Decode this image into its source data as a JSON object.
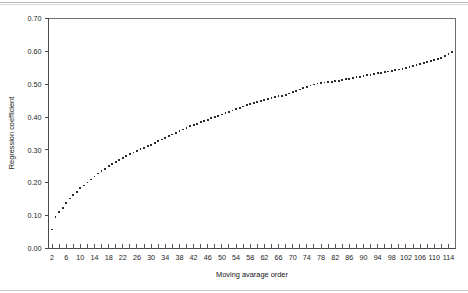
{
  "figure": {
    "background_color": "#ffffff",
    "axis_color": "#4a4a4a",
    "marker_color": "#2b2b2b"
  },
  "chart_data": {
    "type": "scatter",
    "title": "",
    "xlabel": "Moving avarage order",
    "ylabel": "Regression coefficient",
    "xlim": [
      1,
      116
    ],
    "ylim": [
      0.0,
      0.7
    ],
    "grid": false,
    "legend": null,
    "x_ticklabels": [
      "2",
      "6",
      "10",
      "14",
      "18",
      "22",
      "26",
      "30",
      "34",
      "38",
      "42",
      "46",
      "50",
      "54",
      "58",
      "62",
      "66",
      "70",
      "74",
      "78",
      "82",
      "86",
      "90",
      "94",
      "98",
      "102",
      "106",
      "110",
      "114"
    ],
    "x_ticklabel_values": [
      2,
      6,
      10,
      14,
      18,
      22,
      26,
      30,
      34,
      38,
      42,
      46,
      50,
      54,
      58,
      62,
      66,
      70,
      74,
      78,
      82,
      86,
      90,
      94,
      98,
      102,
      106,
      110,
      114
    ],
    "x_minor_tick_step": 2,
    "y_ticklabels": [
      "0.00",
      "0.10",
      "0.20",
      "0.30",
      "0.40",
      "0.50",
      "0.60",
      "0.70"
    ],
    "y_ticklabel_values": [
      0.0,
      0.1,
      0.2,
      0.3,
      0.4,
      0.5,
      0.6,
      0.7
    ],
    "marker": "square",
    "marker_size": 1.8,
    "x": [
      2,
      3,
      4,
      5,
      6,
      7,
      8,
      9,
      10,
      11,
      12,
      13,
      14,
      15,
      16,
      17,
      18,
      19,
      20,
      21,
      22,
      23,
      24,
      25,
      26,
      27,
      28,
      29,
      30,
      31,
      32,
      33,
      34,
      35,
      36,
      37,
      38,
      39,
      40,
      41,
      42,
      43,
      44,
      45,
      46,
      47,
      48,
      49,
      50,
      51,
      52,
      53,
      54,
      55,
      56,
      57,
      58,
      59,
      60,
      61,
      62,
      63,
      64,
      65,
      66,
      67,
      68,
      69,
      70,
      71,
      72,
      73,
      74,
      75,
      76,
      77,
      78,
      79,
      80,
      81,
      82,
      83,
      84,
      85,
      86,
      87,
      88,
      89,
      90,
      91,
      92,
      93,
      94,
      95,
      96,
      97,
      98,
      99,
      100,
      101,
      102,
      103,
      104,
      105,
      106,
      107,
      108,
      109,
      110,
      111,
      112,
      113,
      114,
      115
    ],
    "y": [
      0.058,
      0.097,
      0.11,
      0.124,
      0.139,
      0.152,
      0.163,
      0.173,
      0.183,
      0.192,
      0.201,
      0.21,
      0.219,
      0.228,
      0.236,
      0.243,
      0.25,
      0.257,
      0.263,
      0.269,
      0.275,
      0.281,
      0.287,
      0.292,
      0.297,
      0.302,
      0.307,
      0.311,
      0.316,
      0.32,
      0.326,
      0.332,
      0.337,
      0.342,
      0.347,
      0.352,
      0.357,
      0.362,
      0.367,
      0.372,
      0.376,
      0.38,
      0.384,
      0.388,
      0.392,
      0.396,
      0.4,
      0.404,
      0.408,
      0.412,
      0.416,
      0.42,
      0.424,
      0.428,
      0.432,
      0.436,
      0.44,
      0.443,
      0.446,
      0.449,
      0.452,
      0.455,
      0.458,
      0.461,
      0.463,
      0.465,
      0.468,
      0.472,
      0.476,
      0.48,
      0.484,
      0.488,
      0.492,
      0.496,
      0.499,
      0.502,
      0.504,
      0.505,
      0.506,
      0.507,
      0.509,
      0.511,
      0.513,
      0.515,
      0.517,
      0.519,
      0.521,
      0.523,
      0.525,
      0.527,
      0.529,
      0.531,
      0.533,
      0.535,
      0.537,
      0.539,
      0.541,
      0.543,
      0.545,
      0.547,
      0.55,
      0.553,
      0.556,
      0.559,
      0.562,
      0.565,
      0.568,
      0.571,
      0.574,
      0.577,
      0.58,
      0.585,
      0.592,
      0.598
    ]
  }
}
